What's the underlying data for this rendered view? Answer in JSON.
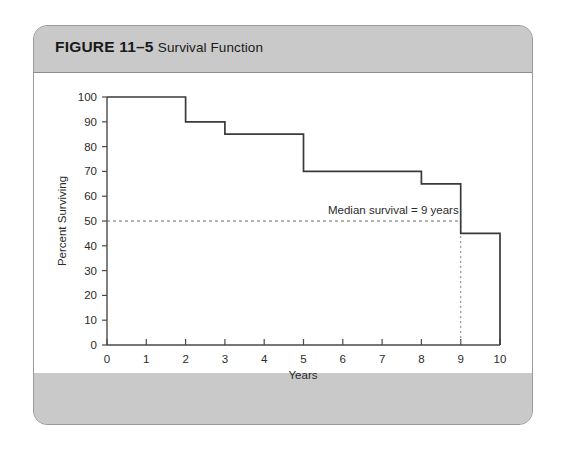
{
  "figure": {
    "number_label": "FIGURE 11–5",
    "caption": "Survival Function"
  },
  "chart_data": {
    "type": "line",
    "title": "Survival Function",
    "xlabel": "Years",
    "ylabel": "Percent Surviving",
    "xlim": [
      0,
      10
    ],
    "ylim": [
      0,
      100
    ],
    "xticks": [
      0,
      1,
      2,
      3,
      4,
      5,
      6,
      7,
      8,
      9,
      10
    ],
    "xtick_labels": [
      "0",
      "1",
      "2",
      "3",
      "4",
      "5",
      "6",
      "7",
      "8",
      "9",
      "10"
    ],
    "yticks": [
      0,
      10,
      20,
      30,
      40,
      50,
      60,
      70,
      80,
      90,
      100
    ],
    "ytick_labels": [
      "0",
      "10",
      "20",
      "30",
      "40",
      "50",
      "60",
      "70",
      "80",
      "90",
      "100"
    ],
    "grid": false,
    "legend": null,
    "step_style": "post-drop",
    "x": [
      0,
      2,
      3,
      5,
      8,
      9,
      10
    ],
    "y": [
      100,
      90,
      85,
      70,
      65,
      45,
      45
    ],
    "steps": [
      {
        "from_x": 0,
        "to_x": 2,
        "value": 100
      },
      {
        "from_x": 2,
        "to_x": 3,
        "value": 90
      },
      {
        "from_x": 3,
        "to_x": 5,
        "value": 85
      },
      {
        "from_x": 5,
        "to_x": 8,
        "value": 70
      },
      {
        "from_x": 8,
        "to_x": 9,
        "value": 65
      },
      {
        "from_x": 9,
        "to_x": 10,
        "value": 45
      }
    ],
    "final_drop_to_zero_at_x": 10,
    "annotations": [
      {
        "text": "Median survival = 9 years",
        "x": 9,
        "y": 50,
        "reference_lines": {
          "horizontal_y": 50,
          "vertical_x": 9
        }
      }
    ]
  }
}
